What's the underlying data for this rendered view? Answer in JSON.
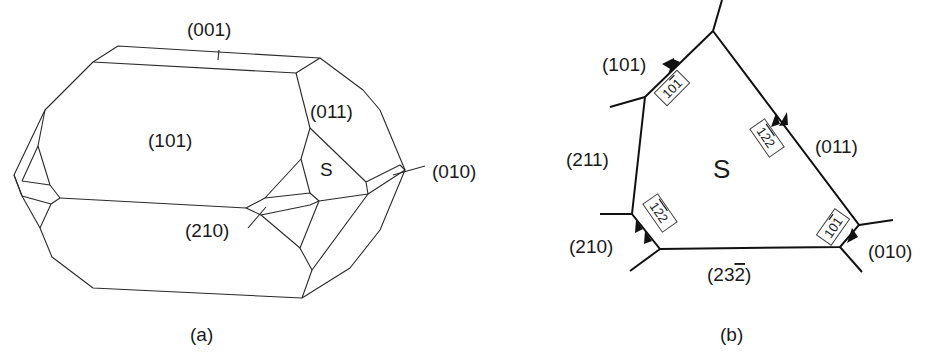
{
  "figure": {
    "panel_a": {
      "caption": "(a)",
      "face_labels": {
        "top": "(001)",
        "front": "(101)",
        "right_upper": "(011)",
        "s_face": "S",
        "right_tip": "(010)",
        "lower_mid": "(210)"
      }
    },
    "panel_b": {
      "caption": "(b)",
      "center_label": "S",
      "face_labels": {
        "upper_left": "(101)",
        "left": "(211)",
        "lower_left": "(210)",
        "bottom": "(23̄ 2̄)",
        "right": "(011)",
        "lower_right": "(010)"
      },
      "bottom_label_plain": "(232̄)",
      "direction_labels": {
        "upper_left_edge": "101̄",
        "right_edge": "1̄2̄2",
        "left_lower_edge": "1̄2̄2",
        "lower_right_edge": "101̄"
      }
    }
  }
}
